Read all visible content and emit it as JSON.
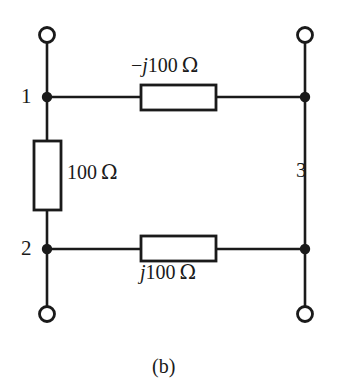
{
  "figure": {
    "caption": "(b)",
    "type": "electrical-circuit-schematic",
    "background_color": "#ffffff",
    "line_color": "#1a1a1a"
  },
  "nodes": [
    {
      "id": "1",
      "label": "1",
      "position": "left-upper"
    },
    {
      "id": "2",
      "label": "2",
      "position": "left-lower"
    },
    {
      "id": "3",
      "label": "3",
      "position": "right-side"
    }
  ],
  "components": [
    {
      "id": "top-branch",
      "label_full": "−j100 Ω",
      "sign": "−",
      "imaginary_unit": "j",
      "magnitude": "100",
      "unit": "Ω",
      "orientation": "horizontal",
      "position": "top",
      "connects": [
        "1",
        "3"
      ]
    },
    {
      "id": "middle-branch",
      "label_full": "100 Ω",
      "sign": "",
      "imaginary_unit": "",
      "magnitude": "100",
      "unit": "Ω",
      "orientation": "vertical",
      "position": "left",
      "connects": [
        "1",
        "2"
      ]
    },
    {
      "id": "bottom-branch",
      "label_full": "j100 Ω",
      "sign": "",
      "imaginary_unit": "j",
      "magnitude": "100",
      "unit": "Ω",
      "orientation": "horizontal",
      "position": "bottom",
      "connects": [
        "2",
        "3"
      ]
    }
  ],
  "terminals": [
    {
      "id": "terminal-top-left",
      "style": "open-circle"
    },
    {
      "id": "terminal-top-right",
      "style": "open-circle"
    },
    {
      "id": "terminal-bottom-left",
      "style": "open-circle"
    },
    {
      "id": "terminal-bottom-right",
      "style": "open-circle"
    }
  ]
}
